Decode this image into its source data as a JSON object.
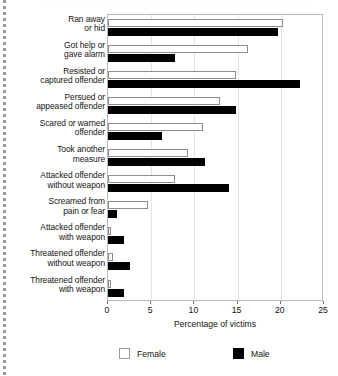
{
  "chart_data": {
    "type": "bar",
    "orientation": "horizontal",
    "title": "",
    "xlabel": "Percentage of victims",
    "ylabel": "",
    "xlim": [
      0,
      25
    ],
    "xticks": [
      0,
      5,
      10,
      15,
      20,
      25
    ],
    "xtick_labels": [
      "0",
      "5",
      "10",
      "15",
      "20",
      "25"
    ],
    "grid": false,
    "legend_position": "bottom",
    "categories": [
      "Ran away\nor hid",
      "Got help or\ngave alarm",
      "Resisted or\ncaptured offender",
      "Persued or\nappeased offender",
      "Scared or warned\noffender",
      "Took another\nmeasure",
      "Attacked offender\nwithout weapon",
      "Screamed from\npain or fear",
      "Attacked offender\nwith weapon",
      "Threatened offender\nwithout weapon",
      "Threatened offender\nwith weapon"
    ],
    "series": [
      {
        "name": "Female",
        "color": "#ffffff",
        "values": [
          20.2,
          16.2,
          14.8,
          13.0,
          11.0,
          9.3,
          7.7,
          4.6,
          0.4,
          0.6,
          0.3
        ]
      },
      {
        "name": "Male",
        "color": "#000000",
        "values": [
          19.7,
          7.8,
          22.2,
          14.8,
          6.2,
          11.2,
          14.0,
          1.0,
          1.9,
          2.6,
          1.9
        ]
      }
    ]
  },
  "legend": {
    "items": [
      {
        "label": "Female"
      },
      {
        "label": "Male"
      }
    ]
  },
  "axis": {
    "xlabel": "Percentage of victims"
  }
}
